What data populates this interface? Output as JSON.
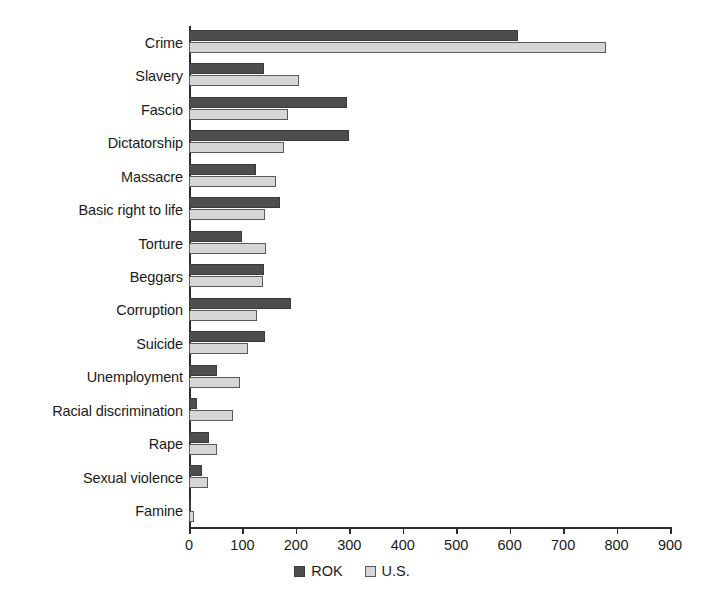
{
  "chart_data": {
    "type": "bar",
    "orientation": "horizontal",
    "title": "",
    "subtitle": "",
    "xlabel": "",
    "ylabel": "",
    "xlim": [
      0,
      900
    ],
    "xticks": [
      0,
      100,
      200,
      300,
      400,
      500,
      600,
      700,
      800,
      900
    ],
    "xtick_labels": [
      "0",
      "100",
      "200",
      "300",
      "400",
      "500",
      "600",
      "700",
      "800",
      "900"
    ],
    "grid": false,
    "legend_position": "bottom-center",
    "categories": [
      "Crime",
      "Slavery",
      "Fascio",
      "Dictatorship",
      "Massacre",
      "Basic right to life",
      "Torture",
      "Beggars",
      "Corruption",
      "Suicide",
      "Unemployment",
      "Racial discrimination",
      "Rape",
      "Sexual violence",
      "Famine"
    ],
    "series": [
      {
        "name": "ROK",
        "color": "#4d4d4d",
        "values": [
          615,
          140,
          295,
          300,
          125,
          170,
          100,
          140,
          190,
          143,
          53,
          15,
          37,
          25,
          3
        ]
      },
      {
        "name": "U.S.",
        "color": "#d6d6d6",
        "values": [
          780,
          205,
          185,
          178,
          163,
          142,
          145,
          138,
          128,
          110,
          95,
          82,
          52,
          35,
          10
        ]
      }
    ]
  },
  "legend": {
    "entries": [
      {
        "label": "ROK",
        "swatch": "rok"
      },
      {
        "label": "U.S.",
        "swatch": "us"
      }
    ]
  },
  "colors": {
    "rok": "#4d4d4d",
    "us": "#d6d6d6",
    "axis": "#2b2b2b",
    "text": "#1a1a1a",
    "background": "#ffffff"
  }
}
